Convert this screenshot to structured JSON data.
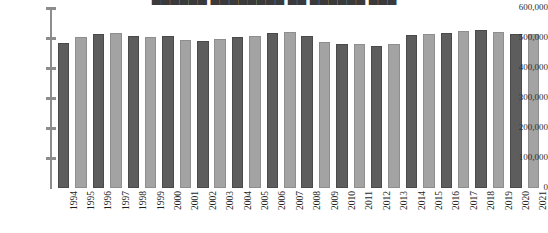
{
  "chart": {
    "title_cropped": "██████ ████████ ██ ██████ ███",
    "zero_label": "0"
  },
  "chart_data": {
    "type": "bar",
    "title": "",
    "xlabel": "",
    "ylabel": "",
    "ylim": [
      0,
      600000
    ],
    "grid": false,
    "legend": "none",
    "ytick_labels": [
      "600,000",
      "500,000",
      "400,000",
      "300,000",
      "200,000",
      "100,000"
    ],
    "ytick_values": [
      600000,
      500000,
      400000,
      300000,
      200000,
      100000
    ],
    "categories": [
      "1994",
      "1995",
      "1996",
      "1997",
      "1998",
      "1999",
      "2000",
      "2001",
      "2002",
      "2003",
      "2004",
      "2005",
      "2006",
      "2007",
      "2008",
      "2009",
      "2010",
      "2011",
      "2012",
      "2013",
      "2014",
      "2015",
      "2016",
      "2017",
      "2018",
      "2019",
      "2020",
      "2021"
    ],
    "values": [
      484000,
      503000,
      514000,
      518000,
      508000,
      503000,
      508000,
      495000,
      491000,
      496000,
      504000,
      508000,
      518000,
      519000,
      508000,
      487000,
      479000,
      479000,
      474000,
      481000,
      510000,
      515000,
      518000,
      524000,
      527000,
      521000,
      513000,
      515000
    ],
    "bar_colors": [
      "dark",
      "light",
      "dark",
      "light",
      "dark",
      "light",
      "dark",
      "light",
      "dark",
      "light",
      "dark",
      "light",
      "dark",
      "light",
      "dark",
      "light",
      "dark",
      "light",
      "dark",
      "light",
      "dark",
      "light",
      "dark",
      "light",
      "dark",
      "light",
      "dark",
      "light"
    ],
    "colors": {
      "dark": "#5d5d5d",
      "light": "#a3a3a3",
      "axis": "#8d8d8d",
      "text": "#2f2f2f",
      "background": "#ffffff"
    }
  }
}
